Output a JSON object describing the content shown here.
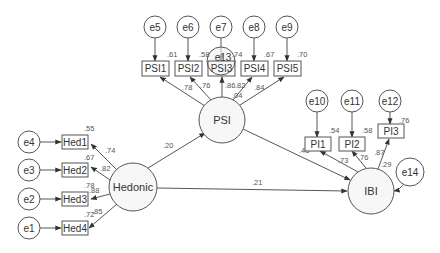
{
  "diagram": {
    "type": "structural-equation-model",
    "latents": {
      "hedonic": {
        "label": "Hedonic"
      },
      "psi": {
        "label": "PSI"
      },
      "ibi": {
        "label": "IBI"
      }
    },
    "indicators": {
      "hed1": {
        "label": "Hed1",
        "r2": ".55",
        "loading": ".74"
      },
      "hed2": {
        "label": "Hed2",
        "r2": ".67",
        "loading": ".82"
      },
      "hed3": {
        "label": "Hed3",
        "r2": ".78",
        "loading": ".88"
      },
      "hed4": {
        "label": "Hed4",
        "r2": ".72",
        "loading": ".85"
      },
      "psi1": {
        "label": "PSI1",
        "r2": ".61",
        "loading": ".78"
      },
      "psi2": {
        "label": "PSI2",
        "r2": ".58",
        "loading": ".76"
      },
      "psi3": {
        "label": "PSI3",
        "r2": ".74",
        "loading": ".86"
      },
      "psi4": {
        "label": "PSI4",
        "r2": ".67",
        "loading": ".82"
      },
      "psi5": {
        "label": "PSI5",
        "r2": ".70",
        "loading": ".84"
      },
      "pi1": {
        "label": "PI1",
        "r2": ".54",
        "loading": ".73"
      },
      "pi2": {
        "label": "PI2",
        "r2": ".58",
        "loading": ".76"
      },
      "pi3": {
        "label": "PI3",
        "r2": ".76",
        "loading": ".87"
      }
    },
    "errors": {
      "e1": "e1",
      "e2": "e2",
      "e3": "e3",
      "e4": "e4",
      "e5": "e5",
      "e6": "e6",
      "e7": "e7",
      "e8": "e8",
      "e9": "e9",
      "e10": "e10",
      "e11": "e11",
      "e12": "e12",
      "e13": "e13",
      "e14": "e14"
    },
    "structural_paths": {
      "hedonic_to_psi": ".20",
      "hedonic_to_ibi": ".21",
      "psi_to_ibi": ".46"
    },
    "r2_latent": {
      "psi": ".04",
      "ibi": ".29"
    }
  }
}
